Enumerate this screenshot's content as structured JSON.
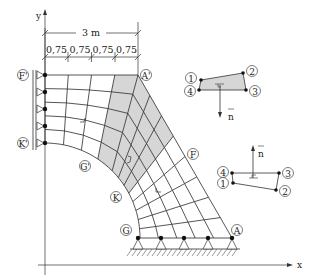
{
  "figure": {
    "axes": {
      "x_label": "x",
      "y_label": "y"
    },
    "dimensions": {
      "total": "3 m",
      "segments": [
        "0,75",
        "0,75",
        "0,75",
        "0,75"
      ]
    },
    "points": {
      "F_prime": "F'",
      "A_prime": "A'",
      "K_prime": "K'",
      "G_prime": "G'",
      "F": "F",
      "K": "K",
      "G": "G",
      "A": "A"
    },
    "element_top": {
      "nodes": [
        "1",
        "2",
        "3",
        "4"
      ],
      "normal_label": "n",
      "normal_direction": "down"
    },
    "element_bottom": {
      "nodes": [
        "4",
        "3",
        "1",
        "2"
      ],
      "normal_label": "n",
      "normal_direction": "up"
    },
    "colors": {
      "shaded_region": "#d6d6d6",
      "lines": "#2a2a2a"
    }
  }
}
